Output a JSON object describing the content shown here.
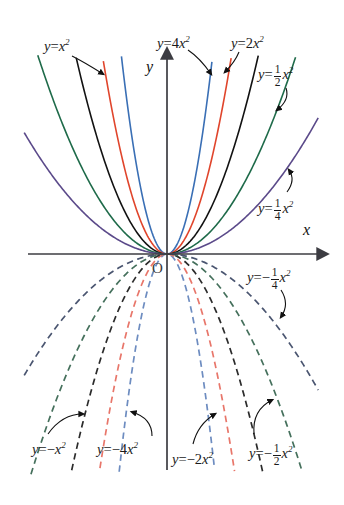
{
  "figure": {
    "background": "#ffffff",
    "width": 344,
    "height": 505
  },
  "axes": {
    "x_label": "x",
    "y_label": "y",
    "origin_label": "O",
    "axis_color": "#3c3c42",
    "origin_px": {
      "x": 167,
      "y": 254
    },
    "x_axis_px": {
      "x1": 28,
      "x2": 318,
      "y": 254
    },
    "y_axis_px": {
      "x": 167,
      "y1": 58,
      "y2": 470
    },
    "px_per_unit_x": 42,
    "px_per_unit_y": 42
  },
  "chart_data": {
    "type": "line",
    "xlabel": "x",
    "ylabel": "y",
    "xlim": [
      -3.4,
      3.6
    ],
    "ylim": [
      -5.2,
      4.7
    ],
    "grid": false,
    "legend": "inline-annotations",
    "x": [
      -3.4,
      -3.0,
      -2.6,
      -2.2,
      -1.8,
      -1.4,
      -1.0,
      -0.6,
      -0.2,
      0,
      0.2,
      0.6,
      1.0,
      1.4,
      1.8,
      2.2,
      2.6,
      3.0,
      3.4
    ],
    "series": [
      {
        "name": "y = 4x²",
        "coefficient": 4,
        "color": "#3a6fb5",
        "style": "solid",
        "label": "y = 4x²"
      },
      {
        "name": "y = 2x²",
        "coefficient": 2,
        "color": "#e0452c",
        "style": "solid",
        "label": "y = 2x²"
      },
      {
        "name": "y = x²",
        "coefficient": 1,
        "color": "#121212",
        "style": "solid",
        "label": "y = x²"
      },
      {
        "name": "y = 1/2 x²",
        "coefficient": 0.5,
        "color": "#1f6b4a",
        "style": "solid",
        "label": "y = ½ x²"
      },
      {
        "name": "y = 1/4 x²",
        "coefficient": 0.25,
        "color": "#5b4a8a",
        "style": "solid",
        "label": "y = ¼ x²"
      },
      {
        "name": "y = -4x²",
        "coefficient": -4,
        "color": "#6d8cc0",
        "style": "dashed",
        "label": "y = -4x²"
      },
      {
        "name": "y = -2x²",
        "coefficient": -2,
        "color": "#e8766a",
        "style": "dashed",
        "label": "y = -2x²"
      },
      {
        "name": "y = -x²",
        "coefficient": -1,
        "color": "#2b2b2b",
        "style": "dashed",
        "label": "y = -x²"
      },
      {
        "name": "y = -1/2 x²",
        "coefficient": -0.5,
        "color": "#45705c",
        "style": "dashed",
        "label": "y = -½ x²"
      },
      {
        "name": "y = -1/4 x²",
        "coefficient": -0.25,
        "color": "#4a5570",
        "style": "dashed",
        "label": "y = -¼ x²"
      }
    ]
  },
  "annotations": [
    {
      "id": "y-eq-x2",
      "lhs": "y",
      "eq": "=",
      "coef": "",
      "sign": "",
      "frac": null,
      "var": "x",
      "exp": "2",
      "x": 44,
      "y": 38,
      "arrow": {
        "x1": 72,
        "y1": 56,
        "cx": 84,
        "cy": 62,
        "x2": 103,
        "y2": 74
      }
    },
    {
      "id": "y-eq-4x2",
      "lhs": "y",
      "eq": "=",
      "coef": "4",
      "sign": "",
      "frac": null,
      "var": "x",
      "exp": "2",
      "x": 157,
      "y": 35,
      "arrow": {
        "x1": 188,
        "y1": 50,
        "cx": 200,
        "cy": 58,
        "x2": 211,
        "y2": 74
      }
    },
    {
      "id": "y-eq-2x2",
      "lhs": "y",
      "eq": "=",
      "coef": "2",
      "sign": "",
      "frac": null,
      "var": "x",
      "exp": "2",
      "x": 231,
      "y": 35,
      "arrow": {
        "x1": 239,
        "y1": 52,
        "cx": 235,
        "cy": 62,
        "x2": 225,
        "y2": 72
      }
    },
    {
      "id": "y-eq-half-x2",
      "lhs": "y",
      "eq": "=",
      "coef": "",
      "sign": "",
      "frac": {
        "n": "1",
        "d": "2"
      },
      "var": "x",
      "exp": "2",
      "x": 258,
      "y": 64,
      "arrow": {
        "x1": 286,
        "y1": 88,
        "cx": 290,
        "cy": 100,
        "x2": 277,
        "y2": 110
      }
    },
    {
      "id": "y-eq-quarter-x2",
      "lhs": "y",
      "eq": "=",
      "coef": "",
      "sign": "",
      "frac": {
        "n": "1",
        "d": "4"
      },
      "var": "x",
      "exp": "2",
      "x": 258,
      "y": 198,
      "arrow": {
        "x1": 287,
        "y1": 192,
        "cx": 296,
        "cy": 180,
        "x2": 289,
        "y2": 170
      }
    },
    {
      "id": "y-eq-neg-quarter-x2",
      "lhs": "y",
      "eq": "=",
      "coef": "",
      "sign": "−",
      "frac": {
        "n": "1",
        "d": "4"
      },
      "var": "x",
      "exp": "2",
      "x": 247,
      "y": 267,
      "arrow": {
        "x1": 281,
        "y1": 290,
        "cx": 290,
        "cy": 304,
        "x2": 281,
        "y2": 317
      }
    },
    {
      "id": "y-eq-neg-x2",
      "lhs": "y",
      "eq": "=",
      "coef": "",
      "sign": "−",
      "frac": null,
      "var": "x",
      "exp": "2",
      "x": 32,
      "y": 441,
      "arrow": {
        "x1": 48,
        "y1": 434,
        "cx": 62,
        "cy": 414,
        "x2": 83,
        "y2": 414
      }
    },
    {
      "id": "y-eq-neg-4x2",
      "lhs": "y",
      "eq": "=",
      "coef": "4",
      "sign": "−",
      "frac": null,
      "var": "x",
      "exp": "2",
      "x": 97,
      "y": 441,
      "arrow": {
        "x1": 152,
        "y1": 436,
        "cx": 152,
        "cy": 418,
        "x2": 132,
        "y2": 412
      }
    },
    {
      "id": "y-eq-neg-2x2",
      "lhs": "y",
      "eq": "=",
      "coef": "2",
      "sign": "−",
      "frac": null,
      "var": "x",
      "exp": "2",
      "x": 172,
      "y": 451,
      "arrow": {
        "x1": 193,
        "y1": 444,
        "cx": 198,
        "cy": 424,
        "x2": 215,
        "y2": 414
      }
    },
    {
      "id": "y-eq-neg-half-x2",
      "lhs": "y",
      "eq": "=",
      "coef": "",
      "sign": "−",
      "frac": {
        "n": "1",
        "d": "2"
      },
      "var": "x",
      "exp": "2",
      "x": 249,
      "y": 443,
      "arrow": {
        "x1": 254,
        "y1": 434,
        "cx": 252,
        "cy": 410,
        "x2": 272,
        "y2": 400
      }
    }
  ]
}
